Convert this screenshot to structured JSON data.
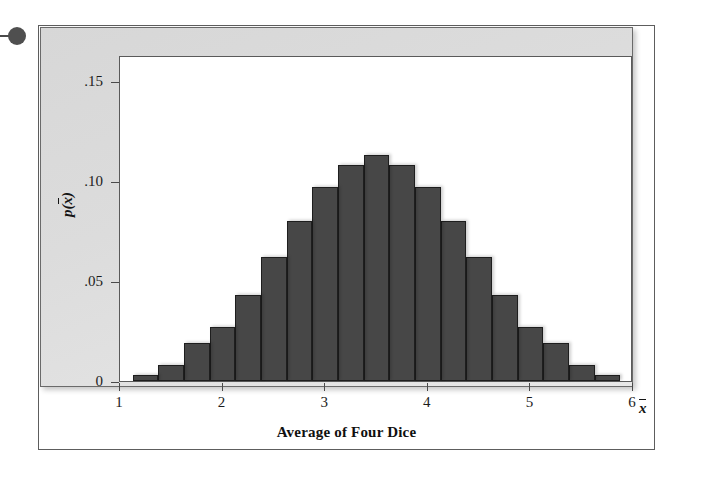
{
  "figure": {
    "bullet_icon": "bullet-dot",
    "panel_background": "#dcdcdc",
    "plot_background": "#ffffff",
    "bar_color": "#474747",
    "bar_border_color": "#1e1e1e",
    "frame_color": "#5d5d5d"
  },
  "chart_data": {
    "type": "bar",
    "title": "",
    "xlabel": "Average of Four Dice",
    "ylabel": "p(x̄)",
    "xlabel_variable": "x̄",
    "x_tick_labels": [
      "1",
      "2",
      "3",
      "4",
      "5",
      "6"
    ],
    "x_ticks": [
      1,
      2,
      3,
      4,
      5,
      6
    ],
    "y_tick_labels": [
      "0",
      ".05",
      ".10",
      ".15"
    ],
    "y_ticks": [
      0,
      0.05,
      0.1,
      0.15
    ],
    "xlim": [
      1,
      6
    ],
    "ylim": [
      0,
      0.163
    ],
    "grid": false,
    "legend": false,
    "bar_width": 0.25,
    "categories": [
      1.25,
      1.5,
      1.75,
      2.0,
      2.25,
      2.5,
      2.75,
      3.0,
      3.25,
      3.5,
      3.75,
      4.0,
      4.25,
      4.5,
      4.75,
      5.0,
      5.25,
      5.5,
      5.75
    ],
    "values": [
      0.003,
      0.008,
      0.019,
      0.027,
      0.043,
      0.062,
      0.08,
      0.097,
      0.108,
      0.113,
      0.108,
      0.097,
      0.08,
      0.062,
      0.043,
      0.027,
      0.019,
      0.008,
      0.003
    ]
  }
}
